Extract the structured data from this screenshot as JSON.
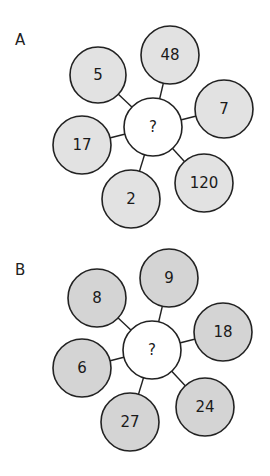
{
  "puzzles": [
    {
      "label": "A",
      "center": {
        "x": 153,
        "y": 127,
        "r": 29,
        "text": "?"
      },
      "fill": "#e2e2e2",
      "outer": [
        {
          "x": 98,
          "y": 75,
          "r": 28,
          "text": "5"
        },
        {
          "x": 170,
          "y": 55,
          "r": 29,
          "text": "48"
        },
        {
          "x": 224,
          "y": 109,
          "r": 29,
          "text": "7"
        },
        {
          "x": 204,
          "y": 183,
          "r": 29,
          "text": "120"
        },
        {
          "x": 131,
          "y": 199,
          "r": 29,
          "text": "2"
        },
        {
          "x": 82,
          "y": 145,
          "r": 29,
          "text": "17"
        }
      ]
    },
    {
      "label": "B",
      "center": {
        "x": 152,
        "y": 350,
        "r": 29,
        "text": "?"
      },
      "fill": "#d4d4d4",
      "outer": [
        {
          "x": 97,
          "y": 298,
          "r": 29,
          "text": "8"
        },
        {
          "x": 169,
          "y": 278,
          "r": 29,
          "text": "9"
        },
        {
          "x": 223,
          "y": 332,
          "r": 29,
          "text": "18"
        },
        {
          "x": 205,
          "y": 407,
          "r": 29,
          "text": "24"
        },
        {
          "x": 130,
          "y": 422,
          "r": 29,
          "text": "27"
        },
        {
          "x": 82,
          "y": 368,
          "r": 29,
          "text": "6"
        }
      ]
    }
  ],
  "labels": {
    "a": "A",
    "b": "B"
  }
}
